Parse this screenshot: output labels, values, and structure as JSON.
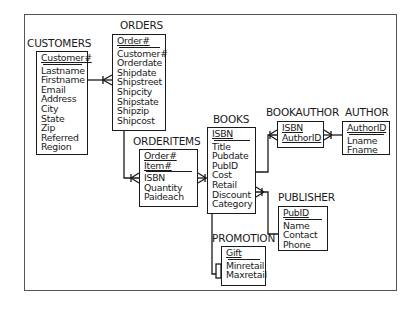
{
  "diagram": {
    "type": "entity-relationship",
    "entities": [
      {
        "id": "customers",
        "name": "CUSTOMERS",
        "keys": [
          "Customer#"
        ],
        "attributes": [
          "Lastname",
          "Firstname",
          "Email",
          "Address",
          "City",
          "State",
          "Zip",
          "Referred",
          "Region"
        ]
      },
      {
        "id": "orders",
        "name": "ORDERS",
        "keys": [
          "Order#"
        ],
        "attributes": [
          "Customer#",
          "Orderdate",
          "Shipdate",
          "Shipstreet",
          "Shipcity",
          "Shipstate",
          "Shipzip",
          "Shipcost"
        ]
      },
      {
        "id": "orderitems",
        "name": "ORDERITEMS",
        "keys": [
          "Order#",
          "Item#"
        ],
        "attributes": [
          "ISBN",
          "Quantity",
          "Paideach"
        ]
      },
      {
        "id": "books",
        "name": "BOOKS",
        "keys": [
          "ISBN"
        ],
        "attributes": [
          "Title",
          "Pubdate",
          "PubID",
          "Cost",
          "Retail",
          "Discount",
          "Category"
        ]
      },
      {
        "id": "bookauthor",
        "name": "BOOKAUTHOR",
        "keys": [
          "ISBN",
          "AuthorID"
        ],
        "attributes": []
      },
      {
        "id": "author",
        "name": "AUTHOR",
        "keys": [
          "AuthorID"
        ],
        "attributes": [
          "Lname",
          "Fname"
        ]
      },
      {
        "id": "publisher",
        "name": "PUBLISHER",
        "keys": [
          "PubID"
        ],
        "attributes": [
          "Name",
          "Contact",
          "Phone"
        ]
      },
      {
        "id": "promotion",
        "name": "PROMOTION",
        "keys": [
          "Gift"
        ],
        "attributes": [
          "Minretail",
          "Maxretail"
        ]
      }
    ],
    "relationships": [
      {
        "from": "CUSTOMERS",
        "to": "ORDERS",
        "cardinality": "one-to-many"
      },
      {
        "from": "ORDERS",
        "to": "ORDERITEMS",
        "cardinality": "one-to-many"
      },
      {
        "from": "BOOKS",
        "to": "ORDERITEMS",
        "cardinality": "one-to-many"
      },
      {
        "from": "BOOKS",
        "to": "BOOKAUTHOR",
        "cardinality": "one-to-many"
      },
      {
        "from": "AUTHOR",
        "to": "BOOKAUTHOR",
        "cardinality": "one-to-many"
      },
      {
        "from": "PUBLISHER",
        "to": "BOOKS",
        "cardinality": "one-to-many"
      },
      {
        "from": "BOOKS",
        "to": "PROMOTION",
        "cardinality": "non-identifying"
      }
    ]
  },
  "colors": {
    "line": "#1a1a1a",
    "frame": "#555555",
    "background": "#ffffff"
  }
}
